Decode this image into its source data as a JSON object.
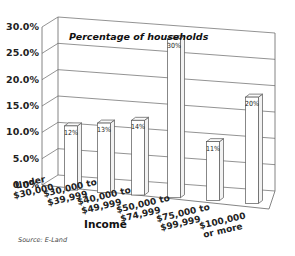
{
  "chart_data": {
    "type": "bar",
    "title": "Percentage of households",
    "xlabel": "Income",
    "ylabel": "",
    "categories": [
      [
        "Under",
        "$30,000"
      ],
      [
        "$30,000 to",
        "$39,999"
      ],
      [
        "$40,000 to",
        "$49,999"
      ],
      [
        "$50,000 to",
        "$74,999"
      ],
      [
        "$75,000 to",
        "$99,999"
      ],
      [
        "$100,000",
        "or more"
      ]
    ],
    "values": [
      12,
      13,
      14,
      30,
      11,
      20
    ],
    "value_labels": [
      "12%",
      "13%",
      "14%",
      "30%",
      "11%",
      "20%"
    ],
    "yticks": [
      "0.0%",
      "5.0%",
      "10.0%",
      "15.0%",
      "20.0%",
      "25.0%",
      "30.0%"
    ],
    "ylim": [
      0,
      30
    ],
    "grid": true,
    "style": "3d",
    "source": "Source: E-Land"
  }
}
